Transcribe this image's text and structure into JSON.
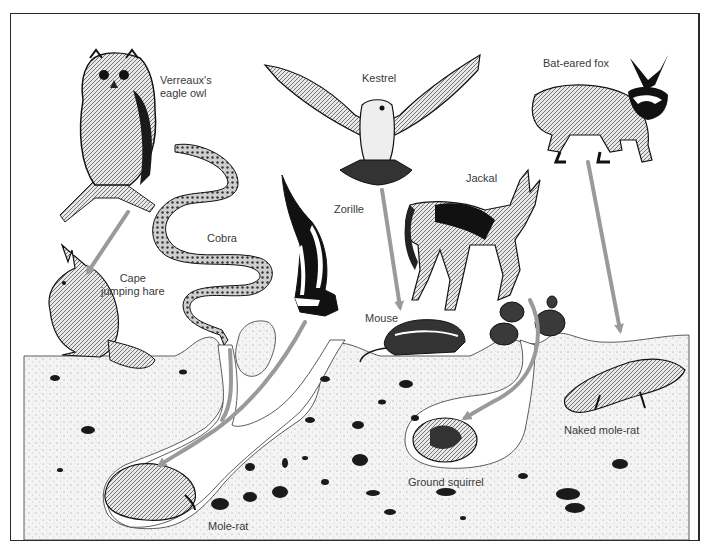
{
  "diagram": {
    "type": "predator-prey illustration",
    "colors": {
      "frame": "#2a2a2a",
      "arrow": "#9a9a9a",
      "ground": "#f1f1f1",
      "ink": "#1a1a1a",
      "label": "#3a3a3a"
    },
    "predators": [
      {
        "id": "owl",
        "label_line1": "Verreaux's",
        "label_line2": "eagle owl"
      },
      {
        "id": "kestrel",
        "label": "Kestrel"
      },
      {
        "id": "bat-eared-fox",
        "label": "Bat-eared fox"
      },
      {
        "id": "cobra",
        "label": "Cobra"
      },
      {
        "id": "zorille",
        "label": "Zorille"
      },
      {
        "id": "jackal",
        "label": "Jackal"
      }
    ],
    "prey": [
      {
        "id": "cape-jumping-hare",
        "label_line1": "Cape",
        "label_line2": "jumping hare"
      },
      {
        "id": "mouse",
        "label": "Mouse"
      },
      {
        "id": "naked-mole-rat",
        "label": "Naked mole-rat"
      },
      {
        "id": "ground-squirrel",
        "label": "Ground squirrel"
      },
      {
        "id": "mole-rat",
        "label": "Mole-rat"
      }
    ],
    "arrows": [
      {
        "from": "Verreaux's eagle owl",
        "to": "Cape jumping hare"
      },
      {
        "from": "Kestrel",
        "to": "Mouse"
      },
      {
        "from": "Bat-eared fox",
        "to": "Naked mole-rat"
      },
      {
        "from": "Cobra",
        "to": "Mole-rat"
      },
      {
        "from": "Zorille",
        "to": "Mole-rat"
      },
      {
        "from": "Jackal",
        "to": "Ground squirrel"
      }
    ]
  }
}
